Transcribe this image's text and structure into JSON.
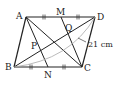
{
  "figure": {
    "shape": "parallelogram",
    "vertices": {
      "A": "A",
      "B": "B",
      "C": "C",
      "D": "D"
    },
    "points": {
      "M": "M",
      "N": "N",
      "P": "P",
      "Q": "Q"
    },
    "measurement_label": "21 cm",
    "segments": [
      "AB",
      "BC",
      "CD",
      "DA",
      "AC",
      "BD",
      "AN",
      "MC"
    ],
    "equal_marks": [
      "AM",
      "MD",
      "BN",
      "NC"
    ],
    "measured_segment": "BD",
    "colors": {
      "line": "#222222",
      "arc": "#aaaaaa"
    }
  }
}
